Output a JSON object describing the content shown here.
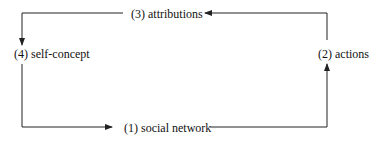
{
  "diagram": {
    "type": "cycle",
    "nodes": [
      {
        "id": "n1",
        "label": "(1) social network"
      },
      {
        "id": "n2",
        "label": "(2) actions"
      },
      {
        "id": "n3",
        "label": "(3) attributions"
      },
      {
        "id": "n4",
        "label": "(4) self-concept"
      }
    ],
    "edges": [
      {
        "from": "(1) social network",
        "to": "(2) actions"
      },
      {
        "from": "(2) actions",
        "to": "(3) attributions"
      },
      {
        "from": "(3) attributions",
        "to": "(4) self-concept"
      },
      {
        "from": "(4) self-concept",
        "to": "(1) social network"
      }
    ],
    "colors": {
      "line": "#222222",
      "text": "#111111",
      "background": "#ffffff"
    }
  }
}
